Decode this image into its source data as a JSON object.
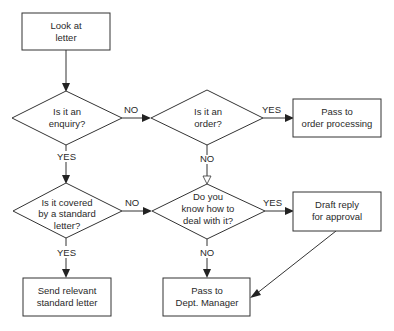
{
  "diagram": {
    "type": "flowchart",
    "nodes": {
      "look": {
        "shape": "process",
        "lines": [
          "Look at",
          "letter"
        ]
      },
      "enquiry": {
        "shape": "decision",
        "lines": [
          "Is it an",
          "enquiry?"
        ]
      },
      "order": {
        "shape": "decision",
        "lines": [
          "Is it an",
          "order?"
        ]
      },
      "order_processing": {
        "shape": "process",
        "lines": [
          "Pass to",
          "order processing"
        ]
      },
      "covered": {
        "shape": "decision",
        "lines": [
          "Is it covered",
          "by a standard",
          "letter?"
        ]
      },
      "know_how": {
        "shape": "decision",
        "lines": [
          "Do you",
          "know how to",
          "deal with it?"
        ]
      },
      "draft_reply": {
        "shape": "process",
        "lines": [
          "Draft reply",
          "for approval"
        ]
      },
      "send_standard": {
        "shape": "process",
        "lines": [
          "Send relevant",
          "standard letter"
        ]
      },
      "dept_manager": {
        "shape": "process",
        "lines": [
          "Pass to",
          "Dept. Manager"
        ]
      }
    },
    "edges": {
      "look_enquiry": {
        "from": "look",
        "to": "enquiry",
        "label": ""
      },
      "enquiry_order": {
        "from": "enquiry",
        "to": "order",
        "label": "NO"
      },
      "order_processing": {
        "from": "order",
        "to": "order_processing",
        "label": "YES"
      },
      "order_know": {
        "from": "order",
        "to": "know_how",
        "label": "NO"
      },
      "enquiry_covered": {
        "from": "enquiry",
        "to": "covered",
        "label": "YES"
      },
      "covered_know": {
        "from": "covered",
        "to": "know_how",
        "label": "NO"
      },
      "know_draft": {
        "from": "know_how",
        "to": "draft_reply",
        "label": "YES"
      },
      "covered_send": {
        "from": "covered",
        "to": "send_standard",
        "label": "YES"
      },
      "know_manager": {
        "from": "know_how",
        "to": "dept_manager",
        "label": "NO"
      },
      "draft_manager": {
        "from": "draft_reply",
        "to": "dept_manager",
        "label": ""
      }
    }
  }
}
